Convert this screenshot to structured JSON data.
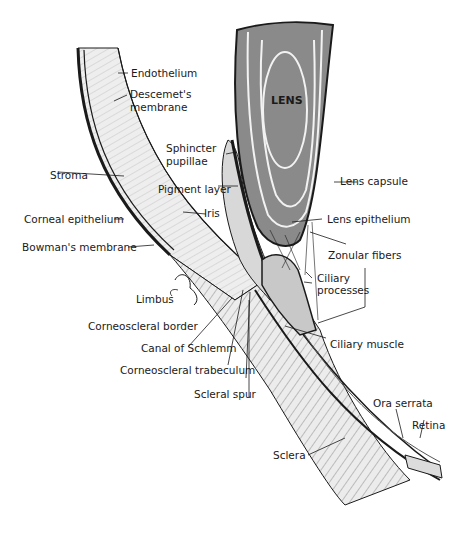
{
  "diagram": {
    "lens_label": "LENS",
    "labels": {
      "endothelium": "Endothelium",
      "descemet_1": "Descemet's",
      "descemet_2": "membrane",
      "stroma": "Stroma",
      "corneal_epithelium": "Corneal epithelium",
      "bowmans_membrane": "Bowman's membrane",
      "limbus": "Limbus",
      "corneoscleral_border": "Corneoscleral border",
      "canal_of_schlemm": "Canal of Schlemm",
      "corneoscleral_trabeculum": "Corneoscleral trabeculum",
      "scleral_spur": "Scleral spur",
      "sclera": "Sclera",
      "sphincter_1": "Sphincter",
      "sphincter_2": "pupillae",
      "pigment_layer": "Pigment layer",
      "iris": "Iris",
      "lens_capsule": "Lens capsule",
      "lens_epithelium": "Lens epithelium",
      "zonular_fibers": "Zonular fibers",
      "ciliary_processes_1": "Ciliary",
      "ciliary_processes_2": "processes",
      "ciliary_muscle": "Ciliary muscle",
      "ora_serrata": "Ora serrata",
      "retina": "Retina"
    },
    "colors": {
      "ink": "#1a1a1a",
      "lens_fill": "#8a8a8a",
      "lens_rings": "#f2f2f2",
      "tissue_light": "#e6e6e6",
      "tissue_mid": "#b5b5b5"
    }
  }
}
